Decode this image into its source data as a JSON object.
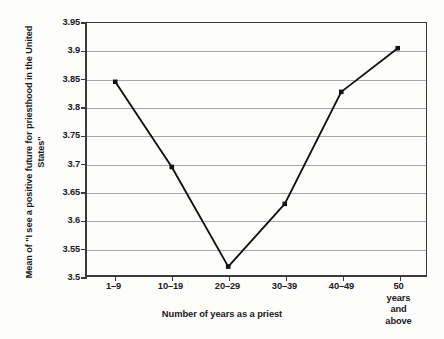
{
  "chart_data": {
    "type": "line",
    "title": "",
    "subtitle": "",
    "xlabel": "Number of years as a priest",
    "ylabel": "Mean of \"I see a positive future for priesthood in the United States\"",
    "ylabel_lines": [
      "Mean of \"I see a positive future for priesthood in the United",
      "States\""
    ],
    "categories": [
      "1–9",
      "10–19",
      "20–29",
      "30–39",
      "40–49",
      "50 years and above"
    ],
    "category_lines": [
      [
        "1–9"
      ],
      [
        "10–19"
      ],
      [
        "20–29"
      ],
      [
        "30–39"
      ],
      [
        "40–49"
      ],
      [
        "50 years",
        "and above"
      ]
    ],
    "values": [
      3.845,
      3.693,
      3.515,
      3.627,
      3.827,
      3.905
    ],
    "ylim": [
      3.5,
      3.95
    ],
    "ytick_values": [
      3.5,
      3.55,
      3.6,
      3.65,
      3.7,
      3.75,
      3.8,
      3.85,
      3.9,
      3.95
    ],
    "ytick_labels": [
      "3.5",
      "3.55",
      "3.6",
      "3.65",
      "3.7",
      "3.75",
      "3.8",
      "3.85",
      "3.9",
      "3.95"
    ],
    "grid": true,
    "grid_axis": "y",
    "legend": false,
    "legend_position": "none",
    "marker": "square",
    "line_color": "#111111",
    "marker_color": "#111111",
    "grid_color": "#a8a8a8",
    "axis_color": "#3a3a3a",
    "background_color": "#fdfdfc"
  }
}
